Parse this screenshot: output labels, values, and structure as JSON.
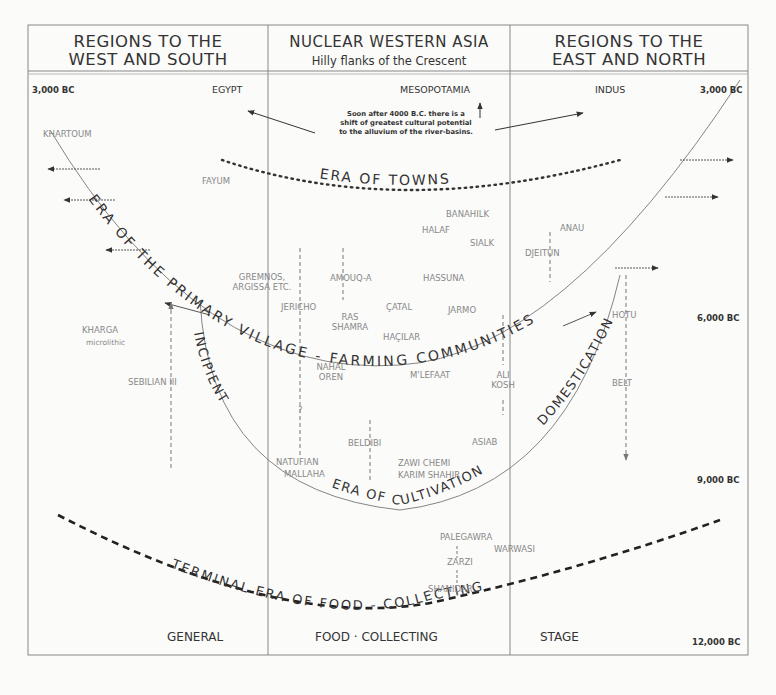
{
  "headers": {
    "west": {
      "line1": "REGIONS TO THE",
      "line2": "WEST AND SOUTH"
    },
    "nuclear": {
      "line1": "NUCLEAR WESTERN ASIA",
      "line2": "Hilly flanks of the Crescent"
    },
    "east": {
      "line1": "REGIONS TO THE",
      "line2": "EAST AND NORTH"
    }
  },
  "dates": {
    "top_left": "3,000 BC",
    "top_right": "3,000 BC",
    "mid_right": "6,000 BC",
    "lower_right": "9,000 BC",
    "bottom_right": "12,000 BC"
  },
  "regions": {
    "egypt": "EGYPT",
    "mesopotamia": "MESOPOTAMIA",
    "indus": "INDUS"
  },
  "note": {
    "line1": "Soon after 4000 B.C. there is a",
    "line2": "shift of greatest cultural potential",
    "line3": "to the alluvium of the river-basins."
  },
  "eras": {
    "towns": "ERA OF TOWNS",
    "primary_village": "ERA OF THE PRIMARY VILLAGE - FARMING COMMUNITIES",
    "incipient": "INCIPIENT",
    "cultivation": "ERA OF CULTIVATION",
    "domestication": "DOMESTICATION",
    "terminal": "TERMINAL ERA OF FOOD - COLLECTING"
  },
  "sites": {
    "khartoum": "KHARTOUM",
    "fayum": "FAYUM",
    "gremnos": "GREMNOS, ARGISSA ETC.",
    "jericho": "JERICHO",
    "amouq": "AMOUQ-A",
    "hassuna": "HASSUNA",
    "banahilk": "BANAHILK",
    "halaf": "HALAF",
    "sialk": "SIALK",
    "anau": "ANAU",
    "djeitun": "DJEITUN",
    "ras_shamra": "RAS SHAMRA",
    "catal": "ÇATAL",
    "hacilar": "HAÇILAR",
    "jarmo": "JARMO",
    "kharga": "KHARGA",
    "kharga_sub": "microlithic",
    "sebilian": "SEBILIAN III",
    "nahal_oren": "NAHAL OREN",
    "mlefaat": "M'LEFAAT",
    "ali_kosh": "ALI KOSH",
    "hotu": "HOTU",
    "belt": "BELT",
    "beldibi": "BELDIBI",
    "asiab": "ASIAB",
    "natufian": "NATUFIAN",
    "mallaha": "MALLAHA",
    "zawi_chemi": "ZAWI CHEMI",
    "karim_shahir": "KARIM SHAHIR",
    "palegawra": "PALEGAWRA",
    "warwasi": "WARWASI",
    "zarzi": "ZARZI",
    "shanidar": "SHANIDAR",
    "question": "?"
  },
  "stage": {
    "general": "GENERAL",
    "food_collecting": "FOOD · COLLECTING",
    "stage": "STAGE"
  },
  "colors": {
    "ink": "#333333",
    "site_gray": "#888888",
    "background": "#fbfbfa"
  }
}
